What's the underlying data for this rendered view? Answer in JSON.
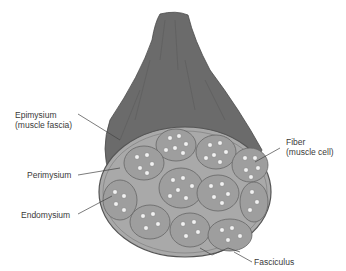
{
  "diagram": {
    "colors": {
      "muscle_outer": "#6b6b6b",
      "cross_section": "#a9a9a9",
      "fascicle": "#9a9a9a",
      "fiber": "#f2f2f2",
      "leader_line": "#444444"
    },
    "labels": {
      "epimysium": {
        "line1": "Epimysium",
        "line2": "(muscle fascia)"
      },
      "perimysium": "Perimysium",
      "endomysium": "Endomysium",
      "fiber": {
        "line1": "Fiber",
        "line2": "(muscle cell)"
      },
      "fasciculus": "Fasciculus"
    }
  }
}
